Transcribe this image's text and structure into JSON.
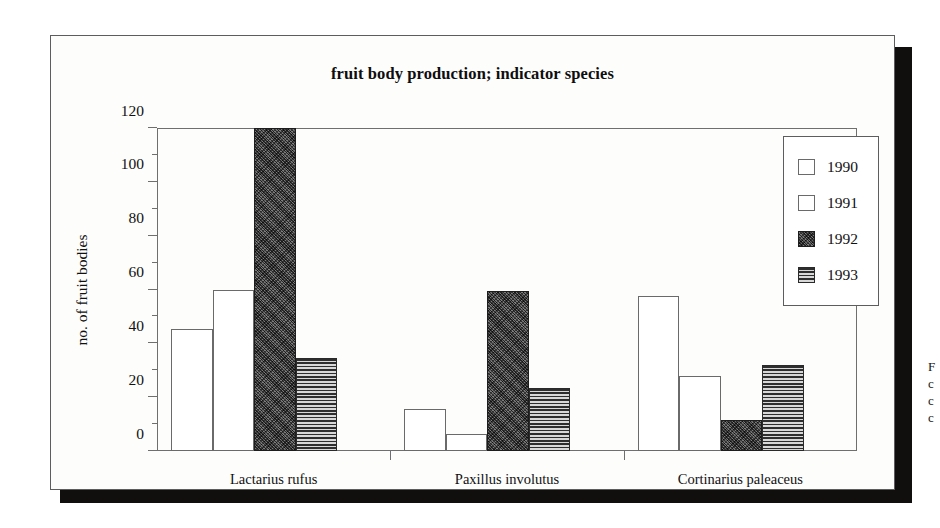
{
  "figure": {
    "title": "fruit body production; indicator species",
    "margin_note_lines": [
      "F",
      "c",
      "c",
      "c"
    ]
  },
  "chart_data": {
    "type": "bar",
    "title": "fruit body production; indicator species",
    "xlabel": "",
    "ylabel": "no. of fruit bodies",
    "ylim": [
      0,
      120
    ],
    "yticks": [
      0,
      20,
      40,
      60,
      80,
      100,
      120
    ],
    "ytick_labels": [
      "0",
      "20",
      "40",
      "60",
      "80",
      "100",
      "120"
    ],
    "grid": false,
    "legend_position": "top-right",
    "categories": [
      "Lactarius rufus",
      "Paxillus involutus",
      "Cortinarius paleaceus"
    ],
    "series": [
      {
        "name": "1990",
        "fill": "white",
        "values": [
          45.5,
          15.5,
          57.5
        ]
      },
      {
        "name": "1991",
        "fill": "white",
        "values": [
          60.0,
          6.5,
          28.0
        ]
      },
      {
        "name": "1992",
        "fill": "noise",
        "values": [
          120.0,
          59.5,
          11.5
        ]
      },
      {
        "name": "1993",
        "fill": "hlines",
        "values": [
          34.5,
          23.5,
          32.0
        ]
      }
    ]
  },
  "legend": {
    "entries": [
      {
        "label": "1990",
        "fill": "white"
      },
      {
        "label": "1991",
        "fill": "white"
      },
      {
        "label": "1992",
        "fill": "noise"
      },
      {
        "label": "1993",
        "fill": "hlines"
      }
    ]
  },
  "colors": {
    "frame": "#5d5d5d",
    "axis": "#6f6f6f",
    "shadow": "#100f0d",
    "bar_white": "#ffffff",
    "bar_dark": "#4b4b4b",
    "bar_hatch": "#2e2e2e",
    "text": "#111111"
  }
}
